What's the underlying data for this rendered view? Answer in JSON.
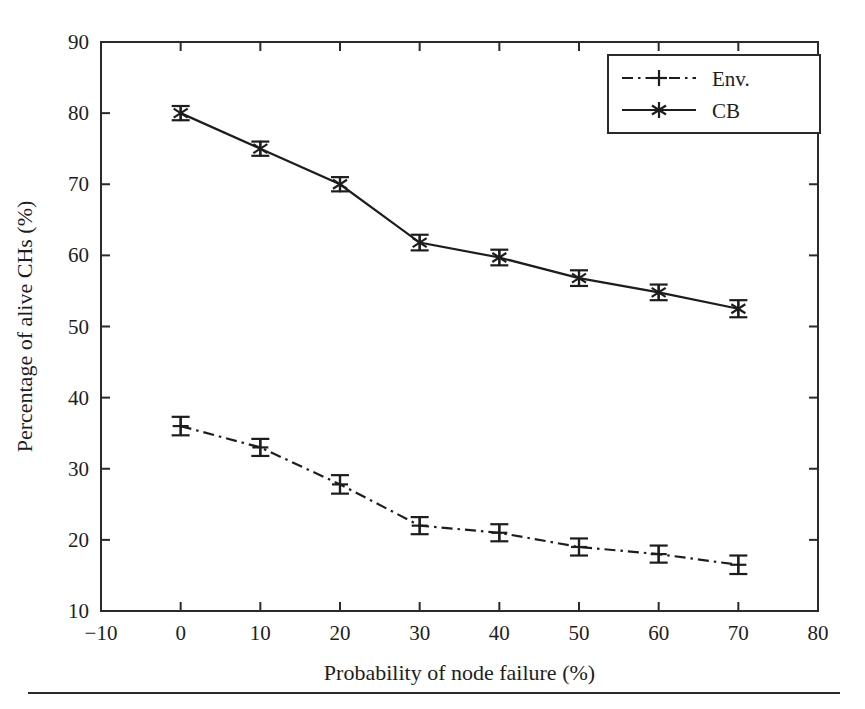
{
  "figure": {
    "background_color": "#ffffff",
    "line_color": "#1d1d1d",
    "axis_color": "#2a2a2a"
  },
  "chart_data": {
    "type": "line",
    "title": "",
    "xlabel": "Probability of node failure (%)",
    "ylabel": "Percentage of alive CHs (%)",
    "xlim": [
      -10,
      80
    ],
    "ylim": [
      10,
      90
    ],
    "xticks": [
      -10,
      0,
      10,
      20,
      30,
      40,
      50,
      60,
      70,
      80
    ],
    "xtick_labels": [
      "−10",
      "0",
      "10",
      "20",
      "30",
      "40",
      "50",
      "60",
      "70",
      "80"
    ],
    "yticks": [
      10,
      20,
      30,
      40,
      50,
      60,
      70,
      80,
      90
    ],
    "ytick_labels": [
      "10",
      "20",
      "30",
      "40",
      "50",
      "60",
      "70",
      "80",
      "90"
    ],
    "grid": false,
    "legend_position": "upper right",
    "x": [
      0,
      10,
      20,
      30,
      40,
      50,
      60,
      70
    ],
    "series": [
      {
        "name": "Env.",
        "legend_label": "Env.",
        "linestyle": "dashdot",
        "marker": "plus",
        "values": [
          36.0,
          33.0,
          27.8,
          22.0,
          21.0,
          19.0,
          18.0,
          16.5
        ],
        "errors": [
          1.3,
          1.2,
          1.3,
          1.2,
          1.2,
          1.2,
          1.2,
          1.3
        ]
      },
      {
        "name": "CB",
        "legend_label": "CB",
        "linestyle": "solid",
        "marker": "asterisk",
        "values": [
          80.0,
          75.0,
          70.0,
          61.8,
          59.7,
          56.8,
          54.8,
          52.5
        ],
        "errors": [
          1.0,
          1.0,
          1.0,
          1.1,
          1.1,
          1.1,
          1.1,
          1.2
        ]
      }
    ]
  }
}
